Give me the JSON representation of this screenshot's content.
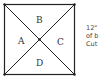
{
  "diagram": {
    "shape": "square divided by both diagonals into four triangles",
    "regions": [
      {
        "id": "A",
        "label": "A",
        "position": "left"
      },
      {
        "id": "B",
        "label": "B",
        "position": "top"
      },
      {
        "id": "C",
        "label": "C",
        "position": "right"
      },
      {
        "id": "D",
        "label": "D",
        "position": "bottom"
      }
    ],
    "side_text": [
      "12\"",
      "of b",
      "Cut"
    ],
    "colors": {
      "line": "#222222",
      "text": "#333333",
      "background": "#ffffff"
    }
  }
}
